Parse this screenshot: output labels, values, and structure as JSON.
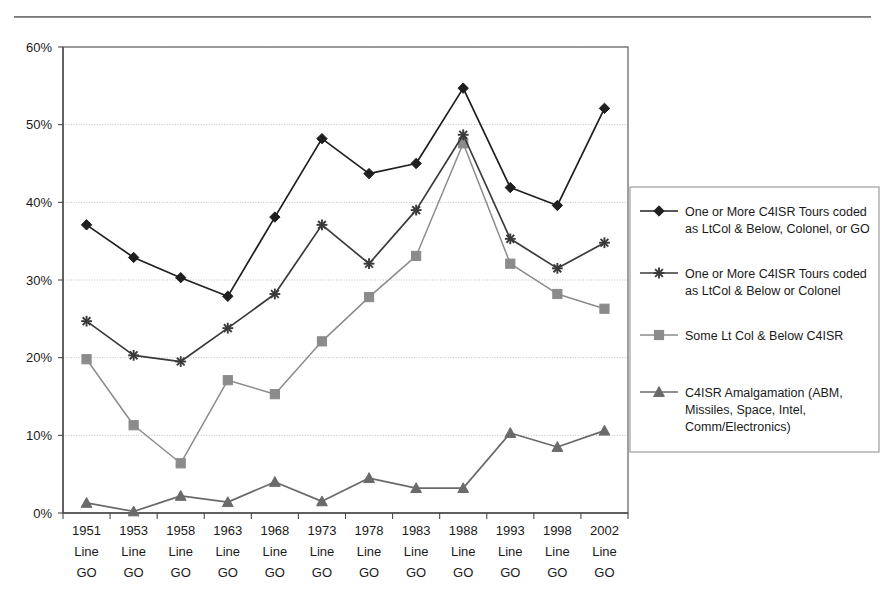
{
  "page": {
    "clipped_caption": "",
    "background": "#ffffff"
  },
  "chart_data": {
    "type": "line",
    "title": "",
    "xlabel": "",
    "ylabel": "",
    "ylim": [
      0,
      60
    ],
    "y_ticks": [
      0,
      10,
      20,
      30,
      40,
      50,
      60
    ],
    "y_tick_labels": [
      "0%",
      "10%",
      "20%",
      "30%",
      "40%",
      "50%",
      "60%"
    ],
    "grid": "horizontal-dotted",
    "legend_position": "right",
    "categories": [
      "1951 Line GO",
      "1953 Line GO",
      "1958 Line GO",
      "1963 Line GO",
      "1968 Line GO",
      "1973 Line GO",
      "1978 Line GO",
      "1983 Line GO",
      "1988 Line GO",
      "1993 Line GO",
      "1998 Line GO",
      "2002 Line GO"
    ],
    "category_lines": [
      [
        "1951",
        "Line",
        "GO"
      ],
      [
        "1953",
        "Line",
        "GO"
      ],
      [
        "1958",
        "Line",
        "GO"
      ],
      [
        "1963",
        "Line",
        "GO"
      ],
      [
        "1968",
        "Line",
        "GO"
      ],
      [
        "1973",
        "Line",
        "GO"
      ],
      [
        "1978",
        "Line",
        "GO"
      ],
      [
        "1983",
        "Line",
        "GO"
      ],
      [
        "1988",
        "Line",
        "GO"
      ],
      [
        "1993",
        "Line",
        "GO"
      ],
      [
        "1998",
        "Line",
        "GO"
      ],
      [
        "2002",
        "Line",
        "GO"
      ]
    ],
    "series": [
      {
        "name": "One or More C4ISR Tours coded as LtCol & Below, Colonel, or GO",
        "label_lines": [
          "One or More C4ISR Tours coded",
          "as LtCol & Below, Colonel, or GO"
        ],
        "marker": "diamond",
        "color": "#1f1f1f",
        "values": [
          37.1,
          32.9,
          30.3,
          27.9,
          38.1,
          48.2,
          43.7,
          45.0,
          54.7,
          41.9,
          39.6,
          52.1
        ]
      },
      {
        "name": "One or More C4ISR Tours coded as LtCol & Below or Colonel",
        "label_lines": [
          "One or More C4ISR Tours coded",
          "as LtCol & Below or Colonel"
        ],
        "marker": "asterisk",
        "color": "#3a3a3a",
        "values": [
          24.7,
          20.3,
          19.5,
          23.8,
          28.2,
          37.1,
          32.1,
          39.0,
          48.7,
          35.3,
          31.5,
          34.8
        ]
      },
      {
        "name": "Some Lt Col & Below C4ISR",
        "label_lines": [
          "Some Lt Col & Below C4ISR"
        ],
        "marker": "square",
        "color": "#8b8b8b",
        "values": [
          19.8,
          11.3,
          6.4,
          17.1,
          15.3,
          22.1,
          27.8,
          33.1,
          47.6,
          32.1,
          28.2,
          26.3
        ]
      },
      {
        "name": "C4ISR Amalgamation (ABM, Missiles, Space, Intel, Comm/Electronics)",
        "label_lines": [
          "C4ISR Amalgamation (ABM,",
          "Missiles, Space, Intel,",
          "Comm/Electronics)"
        ],
        "marker": "triangle",
        "color": "#6a6a6a",
        "values": [
          1.3,
          0.2,
          2.2,
          1.4,
          4.0,
          1.5,
          4.5,
          3.2,
          3.2,
          10.3,
          8.5,
          10.6
        ]
      }
    ]
  }
}
